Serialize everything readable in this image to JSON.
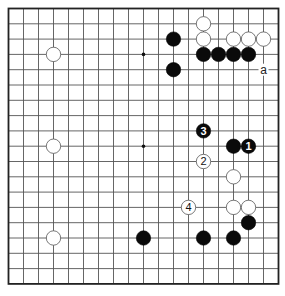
{
  "board": {
    "size": 19,
    "origin_x": 8.5,
    "origin_y": 8.5,
    "spacing_x": 15.0,
    "spacing_y": 15.3,
    "line_color": "#555555",
    "border_color": "#222222",
    "star_points": [
      [
        3,
        3
      ],
      [
        9,
        3
      ],
      [
        15,
        3
      ],
      [
        3,
        9
      ],
      [
        9,
        9
      ],
      [
        15,
        9
      ],
      [
        3,
        15
      ],
      [
        9,
        15
      ],
      [
        15,
        15
      ]
    ]
  },
  "stones": [
    {
      "color": "white",
      "col": 13,
      "row": 1
    },
    {
      "color": "black",
      "col": 11,
      "row": 2
    },
    {
      "color": "white",
      "col": 13,
      "row": 2
    },
    {
      "color": "white",
      "col": 15,
      "row": 2
    },
    {
      "color": "white",
      "col": 16,
      "row": 2
    },
    {
      "color": "white",
      "col": 17,
      "row": 2
    },
    {
      "color": "white",
      "col": 3,
      "row": 3
    },
    {
      "color": "black",
      "col": 13,
      "row": 3
    },
    {
      "color": "black",
      "col": 14,
      "row": 3
    },
    {
      "color": "black",
      "col": 15,
      "row": 3
    },
    {
      "color": "black",
      "col": 16,
      "row": 3
    },
    {
      "color": "black",
      "col": 11,
      "row": 4
    },
    {
      "color": "black",
      "col": 13,
      "row": 8,
      "label": "3"
    },
    {
      "color": "white",
      "col": 3,
      "row": 9
    },
    {
      "color": "black",
      "col": 15,
      "row": 9
    },
    {
      "color": "black",
      "col": 16,
      "row": 9,
      "label": "1"
    },
    {
      "color": "white",
      "col": 13,
      "row": 10,
      "label": "2"
    },
    {
      "color": "white",
      "col": 15,
      "row": 11
    },
    {
      "color": "white",
      "col": 12,
      "row": 13,
      "label": "4"
    },
    {
      "color": "white",
      "col": 15,
      "row": 13
    },
    {
      "color": "white",
      "col": 16,
      "row": 13
    },
    {
      "color": "black",
      "col": 16,
      "row": 14
    },
    {
      "color": "white",
      "col": 3,
      "row": 15
    },
    {
      "color": "black",
      "col": 9,
      "row": 15
    },
    {
      "color": "black",
      "col": 13,
      "row": 15
    },
    {
      "color": "black",
      "col": 15,
      "row": 15
    }
  ],
  "markers": [
    {
      "text": "a",
      "col": 17,
      "row": 4
    }
  ]
}
